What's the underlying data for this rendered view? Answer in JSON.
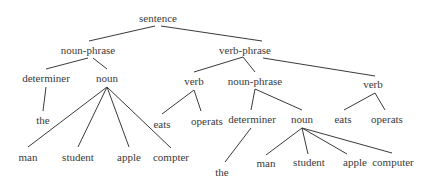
{
  "diagram": {
    "type": "parse-tree",
    "nodes": [
      {
        "id": "sentence",
        "label": "sentence",
        "x": 158,
        "y": 18
      },
      {
        "id": "np1",
        "label": "noun-phrase",
        "x": 88,
        "y": 50
      },
      {
        "id": "vp",
        "label": "verb-phrase",
        "x": 245,
        "y": 50
      },
      {
        "id": "det1",
        "label": "determiner",
        "x": 46,
        "y": 78
      },
      {
        "id": "noun1",
        "label": "noun",
        "x": 107,
        "y": 78
      },
      {
        "id": "verb1",
        "label": "verb",
        "x": 194,
        "y": 81
      },
      {
        "id": "np2",
        "label": "noun-phrase",
        "x": 255,
        "y": 81
      },
      {
        "id": "verb2",
        "label": "verb",
        "x": 373,
        "y": 84
      },
      {
        "id": "the1",
        "label": "the",
        "x": 43,
        "y": 120
      },
      {
        "id": "eats1",
        "label": "eats",
        "x": 162,
        "y": 124
      },
      {
        "id": "operats1",
        "label": "operats",
        "x": 207,
        "y": 121
      },
      {
        "id": "det2",
        "label": "determiner",
        "x": 252,
        "y": 119
      },
      {
        "id": "noun2",
        "label": "noun",
        "x": 302,
        "y": 119
      },
      {
        "id": "eats2",
        "label": "eats",
        "x": 343,
        "y": 119
      },
      {
        "id": "operats2",
        "label": "operats",
        "x": 387,
        "y": 119
      },
      {
        "id": "man1",
        "label": "man",
        "x": 28,
        "y": 157
      },
      {
        "id": "student1",
        "label": "student",
        "x": 78,
        "y": 157
      },
      {
        "id": "apple1",
        "label": "apple",
        "x": 129,
        "y": 157
      },
      {
        "id": "compter1",
        "label": "compter",
        "x": 171,
        "y": 157
      },
      {
        "id": "the2",
        "label": "the",
        "x": 222,
        "y": 172
      },
      {
        "id": "man2",
        "label": "man",
        "x": 266,
        "y": 163
      },
      {
        "id": "student2",
        "label": "student",
        "x": 309,
        "y": 162
      },
      {
        "id": "apple2",
        "label": "apple",
        "x": 355,
        "y": 162
      },
      {
        "id": "computer2",
        "label": "computer",
        "x": 393,
        "y": 162
      }
    ],
    "edges": [
      {
        "from": [
          155,
          26
        ],
        "to": [
          89,
          41
        ]
      },
      {
        "from": [
          161,
          26
        ],
        "to": [
          262,
          41
        ]
      },
      {
        "from": [
          88,
          58
        ],
        "to": [
          46,
          69
        ]
      },
      {
        "from": [
          93,
          58
        ],
        "to": [
          107,
          69
        ]
      },
      {
        "from": [
          243,
          57
        ],
        "to": [
          194,
          72
        ]
      },
      {
        "from": [
          243,
          57
        ],
        "to": [
          255,
          72
        ]
      },
      {
        "from": [
          263,
          58
        ],
        "to": [
          375,
          76
        ]
      },
      {
        "from": [
          46,
          87
        ],
        "to": [
          43,
          111
        ]
      },
      {
        "from": [
          107,
          87
        ],
        "to": [
          28,
          147
        ]
      },
      {
        "from": [
          107,
          87
        ],
        "to": [
          78,
          147
        ]
      },
      {
        "from": [
          107,
          87
        ],
        "to": [
          129,
          147
        ]
      },
      {
        "from": [
          107,
          87
        ],
        "to": [
          171,
          148
        ]
      },
      {
        "from": [
          194,
          90
        ],
        "to": [
          162,
          114
        ]
      },
      {
        "from": [
          194,
          90
        ],
        "to": [
          201,
          111
        ]
      },
      {
        "from": [
          255,
          89
        ],
        "to": [
          251,
          110
        ]
      },
      {
        "from": [
          255,
          89
        ],
        "to": [
          302,
          110
        ]
      },
      {
        "from": [
          375,
          93
        ],
        "to": [
          344,
          110
        ]
      },
      {
        "from": [
          375,
          93
        ],
        "to": [
          385,
          110
        ]
      },
      {
        "from": [
          251,
          128
        ],
        "to": [
          225,
          162
        ]
      },
      {
        "from": [
          302,
          128
        ],
        "to": [
          266,
          155
        ]
      },
      {
        "from": [
          302,
          128
        ],
        "to": [
          308,
          154
        ]
      },
      {
        "from": [
          302,
          128
        ],
        "to": [
          347,
          154
        ]
      },
      {
        "from": [
          302,
          128
        ],
        "to": [
          392,
          153
        ]
      }
    ]
  }
}
